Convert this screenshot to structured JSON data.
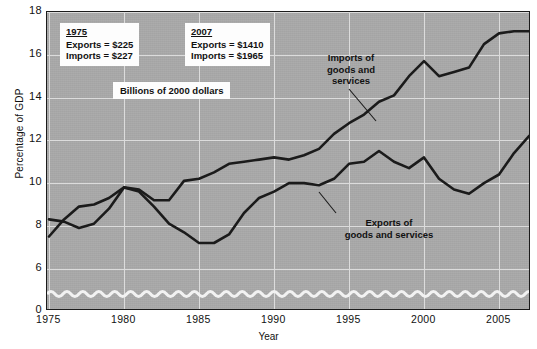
{
  "figure": {
    "top_caption_sliver": "",
    "y_axis_title": "Percentage of GDP",
    "x_axis_title": "Year"
  },
  "annotations": {
    "imports_label": [
      "Imports of",
      "goods and",
      "services"
    ],
    "exports_label": [
      "Exports of",
      "goods and services"
    ],
    "units_note": "Billions of 2000 dollars",
    "box_1975": {
      "year": "1975",
      "exports": "Exports  =  $225",
      "imports": "Imports  =  $227"
    },
    "box_2007": {
      "year": "2007",
      "exports": "Exports  =  $1410",
      "imports": "Imports  =  $1965"
    }
  },
  "colors": {
    "plot_background": "#a9a9a9",
    "gridline": "#dcdcdc",
    "line": "#1b1b1b",
    "frame": "#1b1b1b",
    "box_background": "#fdfdfd"
  },
  "chart_data": {
    "type": "line",
    "title": "",
    "xlabel": "Year",
    "ylabel": "Percentage of GDP",
    "xlim": [
      1975,
      2007
    ],
    "ylim": [
      5,
      18
    ],
    "y_axis_break": true,
    "y_break_value": 0,
    "grid": true,
    "legend": "inline-annotations",
    "yticks": [
      18,
      16,
      14,
      12,
      10,
      8,
      6,
      0
    ],
    "xticks": [
      1975,
      1980,
      1985,
      1990,
      1995,
      2000,
      2005
    ],
    "x": [
      1975,
      1976,
      1977,
      1978,
      1979,
      1980,
      1981,
      1982,
      1983,
      1984,
      1985,
      1986,
      1987,
      1988,
      1989,
      1990,
      1991,
      1992,
      1993,
      1994,
      1995,
      1996,
      1997,
      1998,
      1999,
      2000,
      2001,
      2002,
      2003,
      2004,
      2005,
      2006,
      2007
    ],
    "series": [
      {
        "name": "Exports of goods and services",
        "values": [
          8.3,
          8.2,
          7.9,
          8.1,
          8.8,
          9.8,
          9.6,
          8.9,
          8.1,
          7.7,
          7.2,
          7.2,
          7.6,
          8.6,
          9.3,
          9.6,
          10.0,
          10.0,
          9.9,
          10.2,
          10.9,
          11.0,
          11.5,
          11.0,
          10.7,
          11.2,
          10.2,
          9.7,
          9.5,
          10.0,
          10.4,
          11.4,
          12.2
        ]
      },
      {
        "name": "Imports of goods and services",
        "values": [
          7.5,
          8.3,
          8.9,
          9.0,
          9.3,
          9.8,
          9.7,
          9.2,
          9.2,
          10.1,
          10.2,
          10.5,
          10.9,
          11.0,
          11.1,
          11.2,
          11.1,
          11.3,
          11.6,
          12.3,
          12.8,
          13.2,
          13.8,
          14.1,
          15.0,
          15.7,
          15.0,
          15.2,
          15.4,
          16.5,
          17.0,
          17.1,
          17.1
        ]
      }
    ],
    "notes": [
      "1975: Exports = $225 billion, Imports = $227 billion (2000 dollars)",
      "2007: Exports = $1410 billion, Imports = $1965 billion (2000 dollars)"
    ]
  },
  "geometry": {
    "plot_left": 46,
    "plot_top": 11,
    "plot_width": 484,
    "plot_height": 299,
    "data_top_value": 18,
    "data_bottom_value": 5,
    "data_area_bottom_px": 278
  }
}
